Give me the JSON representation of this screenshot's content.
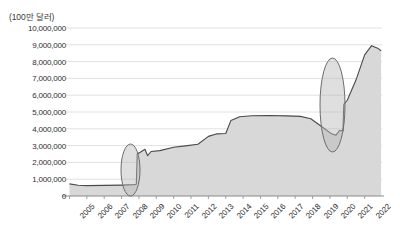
{
  "chart_data": {
    "type": "area",
    "title": "",
    "unit_label": "(100만 달러)",
    "xlabel": "",
    "ylabel": "",
    "ylim": [
      0,
      10000000
    ],
    "ytick_labels": [
      "10,000,000",
      "9,000,000",
      "8,000,000",
      "7,000,000",
      "6,000,000",
      "5,000,000",
      "4,000,000",
      "3,000,000",
      "2,000,000",
      "1,000,000",
      "0"
    ],
    "ytick_values": [
      10000000,
      9000000,
      8000000,
      7000000,
      6000000,
      5000000,
      4000000,
      3000000,
      2000000,
      1000000,
      0
    ],
    "grid": true,
    "legend": null,
    "categories": [
      "2005",
      "2006",
      "2007",
      "2008",
      "2009",
      "2010",
      "2011",
      "2012",
      "2013",
      "2014",
      "2015",
      "2016",
      "2017",
      "2018",
      "2019",
      "2020",
      "2021",
      "2022"
    ],
    "x": [
      2005,
      2006,
      2007,
      2008,
      2009,
      2010,
      2011,
      2012,
      2013,
      2014,
      2015,
      2016,
      2017,
      2018,
      2019,
      2020,
      2021,
      2022
    ],
    "series": [
      {
        "name": "value",
        "values": [
          700000,
          640000,
          620000,
          660000,
          700000,
          2650000,
          2900000,
          3200000,
          3600000,
          4550000,
          4750000,
          4780000,
          4760000,
          4700000,
          4300000,
          3700000,
          5550000,
          8950000
        ]
      }
    ],
    "dense_points": [
      {
        "x": 2005.0,
        "y": 720000
      },
      {
        "x": 2005.5,
        "y": 640000
      },
      {
        "x": 2006.0,
        "y": 620000
      },
      {
        "x": 2007.0,
        "y": 630000
      },
      {
        "x": 2008.0,
        "y": 650000
      },
      {
        "x": 2008.7,
        "y": 680000
      },
      {
        "x": 2008.85,
        "y": 700000
      },
      {
        "x": 2008.9,
        "y": 2500000
      },
      {
        "x": 2009.1,
        "y": 2620000
      },
      {
        "x": 2009.35,
        "y": 2780000
      },
      {
        "x": 2009.5,
        "y": 2400000
      },
      {
        "x": 2009.7,
        "y": 2650000
      },
      {
        "x": 2010.2,
        "y": 2700000
      },
      {
        "x": 2011.0,
        "y": 2900000
      },
      {
        "x": 2011.8,
        "y": 3000000
      },
      {
        "x": 2012.4,
        "y": 3080000
      },
      {
        "x": 2013.0,
        "y": 3550000
      },
      {
        "x": 2013.5,
        "y": 3700000
      },
      {
        "x": 2014.0,
        "y": 3720000
      },
      {
        "x": 2014.3,
        "y": 4500000
      },
      {
        "x": 2014.8,
        "y": 4720000
      },
      {
        "x": 2015.5,
        "y": 4780000
      },
      {
        "x": 2016.5,
        "y": 4790000
      },
      {
        "x": 2017.5,
        "y": 4770000
      },
      {
        "x": 2018.3,
        "y": 4740000
      },
      {
        "x": 2018.9,
        "y": 4600000
      },
      {
        "x": 2019.5,
        "y": 4150000
      },
      {
        "x": 2020.1,
        "y": 3700000
      },
      {
        "x": 2020.35,
        "y": 3620000
      },
      {
        "x": 2020.55,
        "y": 3900000
      },
      {
        "x": 2020.75,
        "y": 3880000
      },
      {
        "x": 2020.8,
        "y": 5450000
      },
      {
        "x": 2021.0,
        "y": 5700000
      },
      {
        "x": 2021.5,
        "y": 6900000
      },
      {
        "x": 2022.0,
        "y": 8400000
      },
      {
        "x": 2022.4,
        "y": 8950000
      },
      {
        "x": 2022.75,
        "y": 8800000
      },
      {
        "x": 2022.95,
        "y": 8650000
      }
    ],
    "annotations": [
      {
        "name": "highlight-ellipse-2009",
        "shape": "ellipse",
        "cx": 130.5,
        "cy": 170.0,
        "rx": 9.5,
        "ry": 26.0,
        "note": "marks discontinuity / sharp jump near 2009"
      },
      {
        "name": "highlight-ellipse-2021",
        "shape": "ellipse",
        "cx": 332.5,
        "cy": 105.0,
        "rx": 12.5,
        "ry": 47.0,
        "note": "marks discontinuity / sharp jump near 2021"
      }
    ],
    "colors": {
      "line": "#4a4a4a",
      "area_fill": "#d8d8d8",
      "grid": "#d9d9d9",
      "axis": "#8a8a8a",
      "annotation_stroke": "#6d6d6d",
      "annotation_fill": "#b9b9b9",
      "text": "#2e2e2e",
      "background": "#ffffff"
    }
  }
}
